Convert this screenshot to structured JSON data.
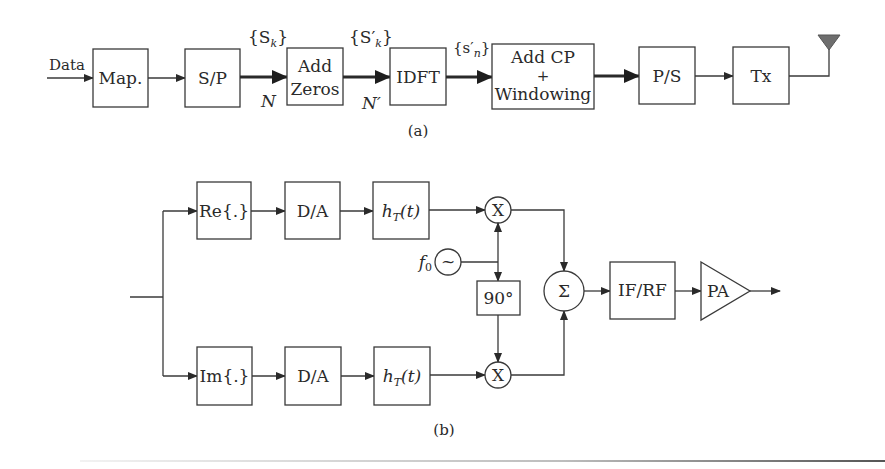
{
  "figure_a": {
    "caption": "(a)",
    "input_label": "Data",
    "blocks": [
      {
        "id": "map",
        "label": "Map."
      },
      {
        "id": "sp",
        "label": "S/P"
      },
      {
        "id": "add-zeros",
        "label_line1": "Add",
        "label_line2": "Zeros"
      },
      {
        "id": "idft",
        "label": "IDFT"
      },
      {
        "id": "add-cp",
        "label_line1": "Add CP",
        "label_line2": "+",
        "label_line3": "Windowing"
      },
      {
        "id": "ps",
        "label": "P/S"
      },
      {
        "id": "tx",
        "label": "Tx"
      }
    ],
    "signals": {
      "sk": "{S",
      "sk_sub": "k",
      "sk_close": "}",
      "sk_prime": "{S′",
      "sk_prime_sub": "k",
      "sk_prime_close": "}",
      "sn_prime": "{s′",
      "sn_prime_sub": "n",
      "sn_prime_close": "}",
      "n_label": "N",
      "n_prime_label": "N′"
    },
    "antenna_color": "#6e6e6e"
  },
  "figure_b": {
    "caption": "(b)",
    "upper_branch": {
      "re_label": "Re{.}",
      "da_label": "D/A",
      "filter_label": "h",
      "filter_sub": "T",
      "filter_arg": "(t)",
      "mixer_label": "X"
    },
    "lower_branch": {
      "im_label": "Im{.}",
      "da_label": "D/A",
      "filter_label": "h",
      "filter_sub": "T",
      "filter_arg": "(t)",
      "mixer_label": "X"
    },
    "oscillator": {
      "freq_label": "f",
      "freq_sub": "0",
      "symbol": "~"
    },
    "phase_shift_label": "90°",
    "summer_label": "Σ",
    "ifrf_label": "IF/RF",
    "pa_label": "PA"
  }
}
